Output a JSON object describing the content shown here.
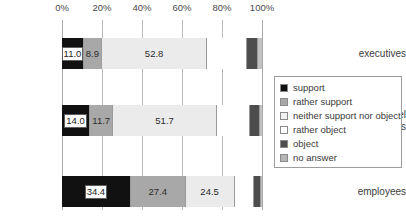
{
  "chart_data": {
    "type": "bar",
    "orientation": "horizontal",
    "stacked": true,
    "normalized_percent": true,
    "title": "",
    "subtitle": "",
    "xlabel": "",
    "ylabel": "",
    "xlim": [
      0,
      100
    ],
    "grid": true,
    "legend_position": "right",
    "categories": [
      "executives",
      "personnel\nmanagers",
      "employees"
    ],
    "tick_labels": [
      "0%",
      "20%",
      "40%",
      "60%",
      "80%",
      "100%"
    ],
    "tick_values": [
      0,
      20,
      40,
      60,
      80,
      100
    ],
    "series": [
      {
        "name": "support",
        "color": "#111111",
        "values": [
          11.0,
          14.0,
          34.4
        ],
        "labels": [
          "11.0",
          "14.0",
          "34.4"
        ]
      },
      {
        "name": "rather support",
        "color": "#a8a8a8",
        "values": [
          8.9,
          11.7,
          27.4
        ],
        "labels": [
          "8.9",
          "11.7",
          "27.4"
        ]
      },
      {
        "name": "neither support nor object",
        "color": "#ebebeb",
        "values": [
          52.8,
          51.7,
          24.5
        ],
        "labels": [
          "52.8",
          "51.7",
          "24.5"
        ]
      },
      {
        "name": "rather object",
        "color": "#ffffff",
        "values": [
          19.8,
          16.4,
          9.6
        ],
        "labels": [
          "",
          "",
          ""
        ]
      },
      {
        "name": "object",
        "color": "#4d4d4d",
        "values": [
          5.3,
          5.0,
          3.6
        ],
        "labels": [
          "",
          "",
          ""
        ]
      },
      {
        "name": "no answer",
        "color": "#c2c2c2",
        "values": [
          2.2,
          1.2,
          0.5
        ],
        "labels": [
          "",
          "",
          ""
        ]
      }
    ]
  },
  "legend": {
    "items": [
      {
        "label": "support",
        "color": "#111111"
      },
      {
        "label": "rather support",
        "color": "#a8a8a8"
      },
      {
        "label": "neither support nor object",
        "color": "#f2f2f2"
      },
      {
        "label": "rather object",
        "color": "#ffffff"
      },
      {
        "label": "object",
        "color": "#4d4d4d"
      },
      {
        "label": "no answer",
        "color": "#b5b5b5"
      }
    ]
  }
}
